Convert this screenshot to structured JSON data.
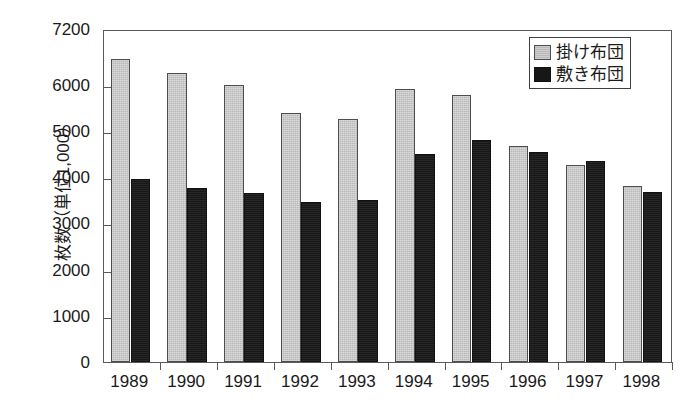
{
  "chart_data": {
    "type": "bar",
    "title": "",
    "subtitle": "",
    "xlabel": "",
    "ylabel": "枚数（単位1,000）",
    "categories": [
      "1989",
      "1990",
      "1991",
      "1992",
      "1993",
      "1994",
      "1995",
      "1996",
      "1997",
      "1998"
    ],
    "series": [
      {
        "name": "掛け布団",
        "color": "#b9b9b9",
        "values": [
          6550,
          6250,
          6000,
          5380,
          5260,
          5900,
          5780,
          4670,
          4250,
          3800
        ]
      },
      {
        "name": "敷き布団",
        "color": "#171717",
        "values": [
          3950,
          3760,
          3650,
          3450,
          3510,
          4490,
          4800,
          4550,
          4350,
          3670
        ]
      }
    ],
    "ylim": [
      0,
      7200
    ],
    "yticks": [
      0,
      1000,
      2000,
      3000,
      4000,
      5000,
      6000,
      7200
    ],
    "ytick_labels": [
      "0",
      "1000",
      "2000",
      "3000",
      "4000",
      "5000",
      "6000",
      "7200"
    ],
    "grid": false,
    "legend_position": "top-right"
  },
  "axis": {
    "y_title": "枚数（単位1,000）"
  },
  "legend": {
    "items": [
      {
        "label": "掛け布団",
        "swatch": "gray-swatch-icon"
      },
      {
        "label": "敷き布団",
        "swatch": "black-swatch-icon"
      }
    ]
  }
}
